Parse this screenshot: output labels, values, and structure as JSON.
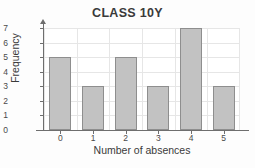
{
  "chart_data": {
    "type": "bar",
    "title": "CLASS 10Y",
    "xlabel": "Number of absences",
    "ylabel": "Frequency",
    "categories": [
      "0",
      "1",
      "2",
      "3",
      "4",
      "5"
    ],
    "values": [
      5,
      3,
      5,
      3,
      7,
      3
    ],
    "ylim": [
      0,
      7
    ],
    "ytick_labels": [
      "0",
      "1",
      "2",
      "3",
      "4",
      "5",
      "6",
      "7"
    ],
    "grid": true,
    "legend": null,
    "colors": {
      "bar_fill": "#c2c2c2",
      "bar_border": "#8e8e8e",
      "grid": "#e6e6e6",
      "axis": "#6e6e6e",
      "text": "#3a3a3a",
      "background": "#fdfdfd"
    }
  }
}
